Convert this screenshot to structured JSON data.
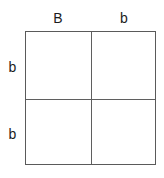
{
  "diagram": {
    "type": "punnett-square",
    "title": "",
    "grid_size": "2x2",
    "colors": {
      "background": "#ffffff",
      "line": "#5a5a5a",
      "text": "#1c1c1c"
    },
    "column_headers": [
      {
        "label": "B"
      },
      {
        "label": "b"
      }
    ],
    "row_headers": [
      {
        "label": "b"
      },
      {
        "label": "b"
      }
    ],
    "cells": [
      {
        "label": ""
      },
      {
        "label": ""
      },
      {
        "label": ""
      },
      {
        "label": ""
      }
    ]
  }
}
